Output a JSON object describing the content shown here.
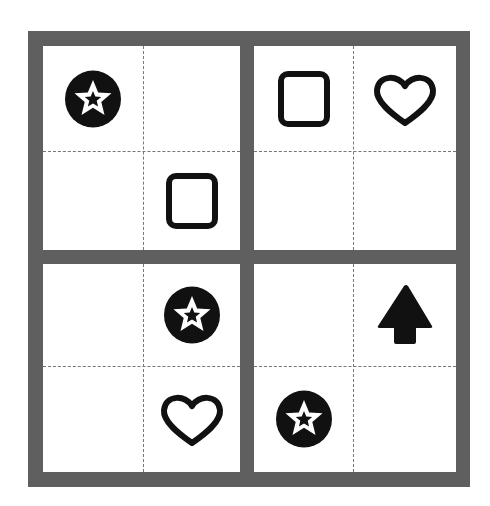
{
  "puzzle": {
    "type": "4x4 symbol grid",
    "border_color": "#5f5f5f",
    "symbol_color": "#111111",
    "rows": [
      [
        "star-circle",
        "empty",
        "square",
        "heart"
      ],
      [
        "empty",
        "square",
        "empty",
        "empty"
      ],
      [
        "empty",
        "star-circle",
        "empty",
        "arrow-up"
      ],
      [
        "empty",
        "heart",
        "star-circle",
        "empty"
      ]
    ]
  }
}
